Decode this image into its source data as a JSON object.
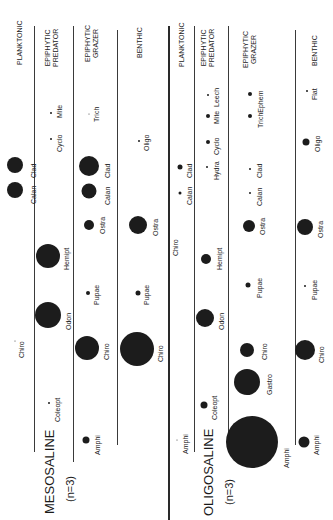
{
  "blocks": [
    {
      "title": "MESOSALINE",
      "n_label": "(n=3)",
      "lanes": [
        {
          "header": [
            "PLANKTONIC"
          ],
          "taxa": [
            {
              "name": "Calan",
              "size": "large"
            },
            {
              "name": "Clad",
              "size": "large"
            },
            {
              "name": "Chiro",
              "size": "trace"
            }
          ]
        },
        {
          "header": [
            "EPIPHYTIC",
            "PREDATOR"
          ],
          "taxa": [
            {
              "name": "Mite",
              "size": "trace"
            },
            {
              "name": "Cyclo",
              "size": "trace"
            },
            {
              "name": "Hemipt",
              "size": "large"
            },
            {
              "name": "Odon",
              "size": "large"
            },
            {
              "name": "Coleopt",
              "size": "trace"
            }
          ]
        },
        {
          "header": [
            "EPIPHYTIC",
            "GRAZER"
          ],
          "taxa": [
            {
              "name": "Trich",
              "size": "trace"
            },
            {
              "name": "Clad",
              "size": "large"
            },
            {
              "name": "Calan",
              "size": "medium"
            },
            {
              "name": "Ostra",
              "size": "small"
            },
            {
              "name": "Pupae",
              "size": "tiny"
            },
            {
              "name": "Chiro",
              "size": "large"
            },
            {
              "name": "Amphi",
              "size": "small"
            }
          ]
        },
        {
          "header": [
            "BENTHIC"
          ],
          "taxa": [
            {
              "name": "Oligo",
              "size": "trace"
            },
            {
              "name": "Ostra",
              "size": "large"
            },
            {
              "name": "Pupae",
              "size": "tiny"
            },
            {
              "name": "Chiro",
              "size": "very large"
            }
          ]
        }
      ]
    },
    {
      "title": "OLIGOSALINE",
      "n_label": "(n=3)",
      "lanes": [
        {
          "header": [
            "PLANKTONIC"
          ],
          "taxa": [
            {
              "name": "Clad",
              "size": "small"
            },
            {
              "name": "Calan",
              "size": "tiny"
            },
            {
              "name": "Chiro",
              "size": "none"
            },
            {
              "name": "Amphi",
              "size": "trace"
            }
          ]
        },
        {
          "header": [
            "EPIPHYTIC",
            "PREDATOR"
          ],
          "taxa": [
            {
              "name": "Leech",
              "size": "trace"
            },
            {
              "name": "Mite",
              "size": "tiny"
            },
            {
              "name": "Cyclo",
              "size": "tiny"
            },
            {
              "name": "Hydra",
              "size": "trace"
            },
            {
              "name": "Hemipt",
              "size": "medium"
            },
            {
              "name": "Odon",
              "size": "large"
            },
            {
              "name": "Coleopt",
              "size": "small"
            }
          ]
        },
        {
          "header": [
            "EPIPHYTIC",
            "GRAZER"
          ],
          "taxa": [
            {
              "name": "Ephem",
              "size": "tiny"
            },
            {
              "name": "Trich",
              "size": "tiny"
            },
            {
              "name": "Clad",
              "size": "trace"
            },
            {
              "name": "Calan",
              "size": "trace"
            },
            {
              "name": "Ostra",
              "size": "medium"
            },
            {
              "name": "Pupae",
              "size": "tiny"
            },
            {
              "name": "Chiro",
              "size": "medium"
            },
            {
              "name": "Gastro",
              "size": "large"
            },
            {
              "name": "Amphi",
              "size": "huge"
            }
          ]
        },
        {
          "header": [
            "BENTHIC"
          ],
          "taxa": [
            {
              "name": "Flat",
              "size": "trace"
            },
            {
              "name": "Oligo",
              "size": "small"
            },
            {
              "name": "Ostra",
              "size": "large"
            },
            {
              "name": "Pupae",
              "size": "trace"
            },
            {
              "name": "Chiro",
              "size": "large"
            },
            {
              "name": "Amphi",
              "size": "small"
            }
          ]
        }
      ]
    }
  ],
  "labels": {
    "m_plank_header": "PLANKTONIC",
    "m_pred_header_1": "EPIPHYTIC",
    "m_pred_header_2": "PREDATOR",
    "m_graz_header_1": "EPIPHYTIC",
    "m_graz_header_2": "GRAZER",
    "m_benth_header": "BENTHIC",
    "m_title": "MESOSALINE",
    "m_n": "(n=3)",
    "m_plank_calan": "Calan",
    "m_plank_clad": "Clad",
    "m_plank_chiro": "Chiro",
    "m_pred_mite": "Mite",
    "m_pred_cyclo": "Cyclo",
    "m_pred_hemipt": "Hemipt",
    "m_pred_odon": "Odon",
    "m_pred_coleopt": "Coleopt",
    "m_graz_trich": "Trich",
    "m_graz_clad": "Clad",
    "m_graz_calan": "Calan",
    "m_graz_ostra": "Ostra",
    "m_graz_pupae": "Pupae",
    "m_graz_chiro": "Chiro",
    "m_graz_amphi": "Amphi",
    "m_benth_oligo": "Oligo",
    "m_benth_ostra": "Ostra",
    "m_benth_pupae": "Pupae",
    "m_benth_chiro": "Chiro",
    "o_plank_header": "PLANKTONIC",
    "o_pred_header_1": "EPIPHYTIC",
    "o_pred_header_2": "PREDATOR",
    "o_graz_header_1": "EPIPHYTIC",
    "o_graz_header_2": "GRAZER",
    "o_benth_header": "BENTHIC",
    "o_title": "OLIGOSALINE",
    "o_n": "(n=3)",
    "o_plank_clad": "Clad",
    "o_plank_calan": "Calan",
    "o_plank_chiro": "Chiro",
    "o_plank_amphi": "Amphi",
    "o_pred_leech": "Leech",
    "o_pred_mite": "Mite",
    "o_pred_cyclo": "Cyclo",
    "o_pred_hydra": "Hydra",
    "o_pred_hemipt": "Hemipt",
    "o_pred_odon": "Odon",
    "o_pred_coleopt": "Coleopt",
    "o_graz_ephem": "Ephem",
    "o_graz_trich": "Trich",
    "o_graz_clad": "Clad",
    "o_graz_calan": "Calan",
    "o_graz_ostra": "Ostra",
    "o_graz_pupae": "Pupae",
    "o_graz_chiro": "Chiro",
    "o_graz_gastro": "Gastro",
    "o_graz_amphi": "Amphi",
    "o_benth_flat": "Flat",
    "o_benth_oligo": "Oligo",
    "o_benth_ostra": "Ostra",
    "o_benth_pupae": "Pupae",
    "o_benth_chiro": "Chiro",
    "o_benth_amphi": "Amphi"
  }
}
